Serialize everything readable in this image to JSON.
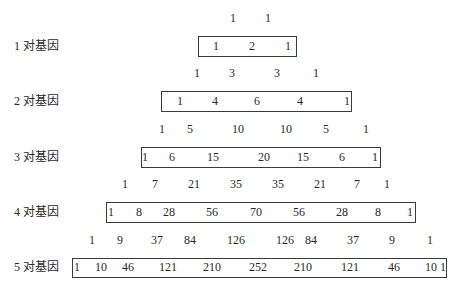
{
  "rows": [
    {
      "type": "parents",
      "values": [
        "1",
        "1"
      ]
    },
    {
      "type": "gene-row",
      "label": "1 对基因",
      "values": [
        "1",
        "2",
        "1"
      ]
    },
    {
      "type": "parents",
      "values": [
        "1",
        "3",
        "3",
        "1"
      ]
    },
    {
      "type": "gene-row",
      "label": "2 对基因",
      "values": [
        "1",
        "4",
        "6",
        "4",
        "1"
      ]
    },
    {
      "type": "parents",
      "values": [
        "1",
        "5",
        "10",
        "10",
        "5",
        "1"
      ]
    },
    {
      "type": "gene-row",
      "label": "3 对基因",
      "values": [
        "1",
        "6",
        "15",
        "20",
        "15",
        "6",
        "1"
      ]
    },
    {
      "type": "parents",
      "values": [
        "1",
        "7",
        "21",
        "35",
        "35",
        "21",
        "7",
        "1"
      ]
    },
    {
      "type": "gene-row",
      "label": "4 对基因",
      "values": [
        "1",
        "8",
        "28",
        "56",
        "70",
        "56",
        "28",
        "8",
        "1"
      ]
    },
    {
      "type": "parents",
      "values": [
        "1",
        "9",
        "37",
        "84",
        "126",
        "126",
        "84",
        "37",
        "9",
        "1"
      ]
    },
    {
      "type": "gene-row",
      "label": "5 对基因",
      "values": [
        "1",
        "10",
        "46",
        "121",
        "210",
        "252",
        "210",
        "121",
        "46",
        "10",
        "1"
      ]
    }
  ]
}
